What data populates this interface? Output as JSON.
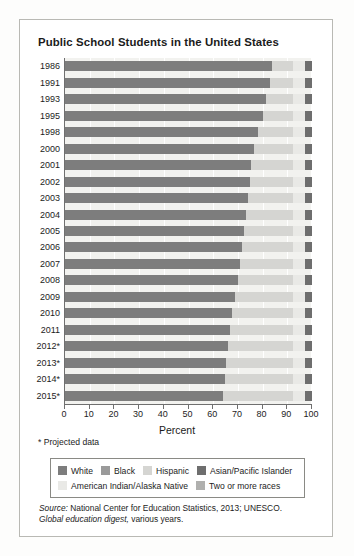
{
  "title": "Public School Students in the United States",
  "footnote": "* Projected data",
  "source": {
    "lead": "Source:",
    "line1": " National Center for Education Statistics, 2013; UNESCO.",
    "line2_italic": "Global education digest,",
    "line2_rest": " various years."
  },
  "legend": {
    "rows": [
      [
        {
          "label": "White",
          "color": "#7d7d7d"
        },
        {
          "label": "Black",
          "color": "#9a9a9a"
        },
        {
          "label": "Hispanic",
          "color": "#d5d5d2"
        },
        {
          "label": "Asian/Pacific Islander",
          "color": "#6e6e6e"
        }
      ],
      [
        {
          "label": "American Indian/Alaska Native",
          "color": "#e9e9e6"
        },
        {
          "label": "Two or more races",
          "color": "#b0b0ae"
        }
      ]
    ]
  },
  "chart_data": {
    "type": "bar",
    "orientation": "horizontal",
    "stacked": true,
    "title": "Public School Students in the United States",
    "xlabel": "Percent",
    "ylabel": "",
    "xlim": [
      0,
      100
    ],
    "xticks": [
      0,
      10,
      20,
      30,
      40,
      50,
      60,
      70,
      80,
      90,
      100
    ],
    "grid": true,
    "legend_position": "bottom",
    "categories": [
      "1986",
      "1991",
      "1993",
      "1995",
      "1998",
      "2000",
      "2001",
      "2002",
      "2003",
      "2004",
      "2005",
      "2006",
      "2007",
      "2008",
      "2009",
      "2010",
      "2011",
      "2012*",
      "2013*",
      "2014*",
      "2015*"
    ],
    "series": [
      {
        "name": "White",
        "color": "#7d7d7d",
        "values": [
          84.0,
          83.0,
          81.5,
          80.0,
          78.0,
          76.5,
          75.5,
          74.7,
          74.0,
          73.4,
          72.6,
          71.8,
          71.0,
          70.0,
          68.9,
          67.5,
          66.8,
          66.0,
          65.3,
          64.6,
          64.0
        ]
      },
      {
        "name": "Black",
        "color": "#9a9a9a",
        "values": [
          0,
          0,
          0,
          0,
          0,
          0,
          0,
          0,
          0,
          0,
          0,
          0,
          0,
          0,
          0,
          0,
          0,
          0,
          0,
          0,
          0
        ]
      },
      {
        "name": "Hispanic",
        "color": "#d5d5d2",
        "values": [
          8.5,
          9.5,
          11.0,
          12.5,
          14.5,
          16.0,
          17.0,
          17.8,
          18.5,
          19.1,
          19.9,
          20.7,
          21.5,
          22.5,
          23.6,
          25.0,
          25.7,
          26.5,
          27.2,
          27.9,
          28.5
        ]
      },
      {
        "name": "American Indian/Alaska Native",
        "color": "#e9e9e6",
        "values": [
          4.5,
          4.5,
          4.5,
          4.5,
          4.5,
          4.5,
          4.5,
          4.5,
          4.5,
          4.5,
          4.5,
          4.5,
          4.5,
          4.5,
          4.5,
          4.5,
          4.5,
          4.5,
          4.5,
          4.5,
          4.5
        ]
      },
      {
        "name": "Asian/Pacific Islander",
        "color": "#6e6e6e",
        "values": [
          3.0,
          3.0,
          3.0,
          3.0,
          3.0,
          3.0,
          3.0,
          3.0,
          3.0,
          3.0,
          3.0,
          3.0,
          3.0,
          3.0,
          3.0,
          3.0,
          3.0,
          3.0,
          3.0,
          3.0,
          3.0
        ]
      },
      {
        "name": "Two or more races",
        "color": "#b0b0ae",
        "values": [
          0,
          0,
          0,
          0,
          0,
          0,
          0,
          0,
          0,
          0,
          0,
          0,
          0,
          0,
          0,
          0,
          0,
          0,
          0,
          0,
          0
        ]
      }
    ]
  }
}
